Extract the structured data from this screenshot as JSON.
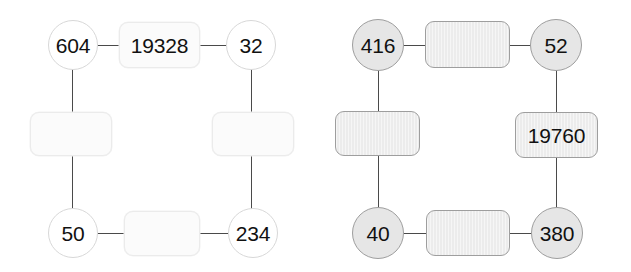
{
  "image": {
    "background_color": "#ffffff",
    "width": 631,
    "height": 272
  },
  "palettes": {
    "light": {
      "circle_fill": "#ffffff",
      "circle_border": "#d8d8d8",
      "box_fill": "#fbfbfb",
      "box_border": "#ebebeb"
    },
    "gray": {
      "circle_fill": "#e6e6e6",
      "circle_border": "#9e9e9e",
      "box_fill": "#ececec",
      "box_border": "#9e9e9e"
    },
    "edge_color": "#4a4a4a",
    "text_color": "#111111"
  },
  "graphs": [
    {
      "id": "left",
      "style": "light",
      "nodes": [
        {
          "id": "l-tl",
          "shape": "circle",
          "position": "top-left",
          "label": "604",
          "font_size": 21
        },
        {
          "id": "l-tm",
          "shape": "box",
          "position": "top-middle",
          "label": "19328",
          "font_size": 21
        },
        {
          "id": "l-tr",
          "shape": "circle",
          "position": "top-right",
          "label": "32",
          "font_size": 21
        },
        {
          "id": "l-ml",
          "shape": "box",
          "position": "middle-left",
          "label": "",
          "font_size": 21
        },
        {
          "id": "l-mr",
          "shape": "box",
          "position": "middle-right",
          "label": "",
          "font_size": 21
        },
        {
          "id": "l-bl",
          "shape": "circle",
          "position": "bottom-left",
          "label": "50",
          "font_size": 21
        },
        {
          "id": "l-bm",
          "shape": "box",
          "position": "bottom-middle",
          "label": "",
          "font_size": 21
        },
        {
          "id": "l-br",
          "shape": "circle",
          "position": "bottom-right",
          "label": "234",
          "font_size": 21
        }
      ],
      "edges": [
        {
          "from": "l-tl",
          "to": "l-tm",
          "orientation": "horizontal"
        },
        {
          "from": "l-tm",
          "to": "l-tr",
          "orientation": "horizontal"
        },
        {
          "from": "l-tl",
          "to": "l-ml",
          "orientation": "vertical"
        },
        {
          "from": "l-ml",
          "to": "l-bl",
          "orientation": "vertical"
        },
        {
          "from": "l-tr",
          "to": "l-mr",
          "orientation": "vertical"
        },
        {
          "from": "l-mr",
          "to": "l-br",
          "orientation": "vertical"
        },
        {
          "from": "l-bl",
          "to": "l-bm",
          "orientation": "horizontal"
        },
        {
          "from": "l-bm",
          "to": "l-br",
          "orientation": "horizontal"
        }
      ]
    },
    {
      "id": "right",
      "style": "gray",
      "nodes": [
        {
          "id": "r-tl",
          "shape": "circle",
          "position": "top-left",
          "label": "416",
          "font_size": 21
        },
        {
          "id": "r-tm",
          "shape": "box",
          "position": "top-middle",
          "label": "",
          "font_size": 21
        },
        {
          "id": "r-tr",
          "shape": "circle",
          "position": "top-right",
          "label": "52",
          "font_size": 21
        },
        {
          "id": "r-ml",
          "shape": "box",
          "position": "middle-left",
          "label": "",
          "font_size": 21
        },
        {
          "id": "r-mr",
          "shape": "box",
          "position": "middle-right",
          "label": "19760",
          "font_size": 21
        },
        {
          "id": "r-bl",
          "shape": "circle",
          "position": "bottom-left",
          "label": "40",
          "font_size": 21
        },
        {
          "id": "r-bm",
          "shape": "box",
          "position": "bottom-middle",
          "label": "",
          "font_size": 21
        },
        {
          "id": "r-br",
          "shape": "circle",
          "position": "bottom-right",
          "label": "380",
          "font_size": 21
        }
      ],
      "edges": [
        {
          "from": "r-tl",
          "to": "r-tm",
          "orientation": "horizontal"
        },
        {
          "from": "r-tm",
          "to": "r-tr",
          "orientation": "horizontal"
        },
        {
          "from": "r-tl",
          "to": "r-ml",
          "orientation": "vertical"
        },
        {
          "from": "r-ml",
          "to": "r-bl",
          "orientation": "vertical"
        },
        {
          "from": "r-tr",
          "to": "r-mr",
          "orientation": "vertical"
        },
        {
          "from": "r-mr",
          "to": "r-br",
          "orientation": "vertical"
        },
        {
          "from": "r-bl",
          "to": "r-bm",
          "orientation": "horizontal"
        },
        {
          "from": "r-bm",
          "to": "r-br",
          "orientation": "horizontal"
        }
      ]
    }
  ]
}
